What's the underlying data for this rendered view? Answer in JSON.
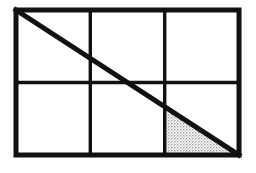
{
  "figure": {
    "kind": "geometry-diagram",
    "canvas": {
      "width": 256,
      "height": 173,
      "background_color": "#FFFFFF"
    },
    "colors": {
      "stroke": "#111111",
      "outer_border": "#111111",
      "grid_line": "#111111",
      "diagonal": "#111111",
      "shade_fill": "#BDBDBD",
      "shade_pattern": "stipple-dots",
      "background": "#FFFFFF"
    },
    "rectangle": {
      "label": "outer-rectangle",
      "x": 16,
      "y": 10,
      "width": 223,
      "height": 145,
      "stroke_width": 5,
      "columns": 3,
      "rows": 2
    },
    "grid": {
      "vertical_divider_x": [
        90.3,
        164.7
      ],
      "horizontal_divider_y": [
        82.5
      ],
      "line_width": 3.4,
      "cell_width": 74.3,
      "cell_height": 72.5
    },
    "diagonal": {
      "label": "main-diagonal",
      "x1": 16,
      "y1": 10,
      "x2": 239,
      "y2": 155,
      "stroke_width": 5
    },
    "shaded_region": {
      "label": "shaded-triangle",
      "shape": "right-triangle",
      "points": "164.7,105.5 164.7,155 239,155",
      "vertices": [
        {
          "x": 164.7,
          "y": 105.5
        },
        {
          "x": 164.7,
          "y": 155
        },
        {
          "x": 239,
          "y": 155
        }
      ],
      "fill_color": "#BDBDBD",
      "pattern": "stipple-dots",
      "fraction_of_cell": "1/2",
      "fraction_of_rectangle": "1/12"
    },
    "annotations": {
      "labels": [],
      "note": ""
    }
  }
}
